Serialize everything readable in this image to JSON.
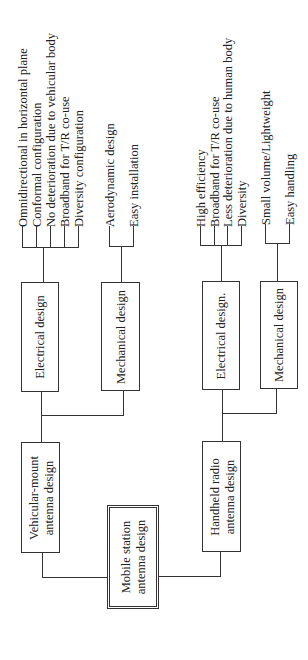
{
  "root": {
    "label_line1": "Mobile station",
    "label_line2": "antenna design"
  },
  "branches": [
    {
      "label_line1": "Vehicular-mount",
      "label_line2": "antenna design",
      "electrical": {
        "label": "Electrical design",
        "items": [
          "Omnidirectional in horizontal plane",
          "Conformal configuration",
          "No deterioration due to vehicular body",
          "Broadband for T/R co-use",
          "Diversity configuration"
        ]
      },
      "mechanical": {
        "label": "Mechanical design",
        "items": [
          "Aerodynamic design",
          "Easy installation"
        ]
      }
    },
    {
      "label_line1": "Handheld radio",
      "label_line2": "antenna design",
      "electrical": {
        "label": "Electrical design.",
        "items": [
          "High efficiency",
          "Broadband for T/R co-use",
          "Less deterioration due to human body",
          "Diversity"
        ]
      },
      "mechanical": {
        "label": "Mechanical design",
        "items": [
          "Small volume/Lightweight",
          "Easy handling"
        ]
      }
    }
  ]
}
